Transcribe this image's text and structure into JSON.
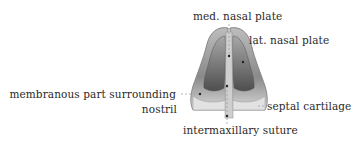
{
  "figure": {
    "type": "anatomical-illustration",
    "colors": {
      "background": "#ffffff",
      "text": "#2a2a2a",
      "leader_line": "#9a9a9a",
      "illustration_light": "#d8d8d8",
      "illustration_mid": "#9c9c9c",
      "illustration_dark": "#5a5a5a"
    }
  },
  "labels": {
    "med_nasal_plate": "med. nasal plate",
    "lat_nasal_plate": "lat. nasal plate",
    "membranous_part_line1": "membranous part surrounding",
    "membranous_part_line2": "nostril",
    "septal_cartilage": "septal cartilage",
    "intermaxillary_suture": "intermaxillary suture"
  }
}
